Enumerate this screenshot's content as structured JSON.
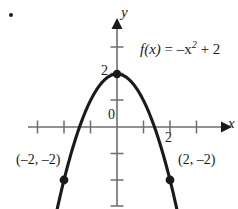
{
  "figure": {
    "bullet": "list-bullet",
    "background_color": "#ffffff",
    "ink_color": "#1a1a1a",
    "axis_color": "#6e6e6e"
  },
  "labels": {
    "y_axis": "y",
    "x_axis": "x",
    "origin": "0",
    "y_tick_2": "2",
    "x_tick_2": "2",
    "left_point": "(–2, –2)",
    "right_point": "(2, –2)",
    "function_prefix": "f",
    "function_arg": "(x)",
    "function_eq": " = –x",
    "function_exp": "2",
    "function_suffix": " + 2"
  },
  "chart_data": {
    "type": "line",
    "title": "",
    "subtitle": "",
    "xlabel": "x",
    "ylabel": "y",
    "equation": "f(x) = -x^2 + 2",
    "function_label_text": "f(x) = –x² + 2",
    "xlim": [
      -3.3,
      4.0
    ],
    "ylim": [
      -3.1,
      3.2
    ],
    "grid": false,
    "legend": null,
    "axes": {
      "x_axis_y_value": 0,
      "y_axis_x_value": 0,
      "x_arrow": "right",
      "y_arrow": "up",
      "x_ticks": [
        -3,
        -2,
        -1,
        1,
        2,
        3
      ],
      "y_ticks": [
        -3,
        -2,
        -1,
        1,
        2,
        3
      ],
      "x_tick_labels_shown": [
        {
          "value": 2,
          "text": "2"
        }
      ],
      "y_tick_labels_shown": [
        {
          "value": 2,
          "text": "2"
        }
      ],
      "origin_label": "0"
    },
    "series": [
      {
        "name": "f(x) = -x^2 + 2",
        "type": "parabola",
        "opens": "down",
        "vertex": [
          0,
          2
        ],
        "x": [
          -2.35,
          -2.0,
          -1.5,
          -1.0,
          -0.5,
          0,
          0.5,
          1.0,
          1.5,
          2.0,
          2.35
        ],
        "values": [
          -3.52,
          -2,
          0.25,
          1,
          1.75,
          2,
          1.75,
          1,
          0.25,
          -2,
          -3.52
        ]
      }
    ],
    "points": [
      {
        "label": "(–2, –2)",
        "x": -2,
        "y": -2,
        "marker": "filled-circle"
      },
      {
        "label": "(2, –2)",
        "x": 2,
        "y": -2,
        "marker": "filled-circle"
      },
      {
        "label": "",
        "x": 0,
        "y": 2,
        "marker": "filled-circle"
      }
    ],
    "annotations": [
      {
        "text": "f(x) = –x² + 2",
        "x": 1.0,
        "y": 2.9
      },
      {
        "text": "(–2, –2)",
        "x": -3.0,
        "y": -1.2
      },
      {
        "text": "(2, –2)",
        "x": 2.4,
        "y": -1.2
      }
    ],
    "arrows": [
      {
        "from": [
          -2.0,
          -2
        ],
        "to": [
          -2.45,
          -3.0
        ],
        "style": "curve-end-arrow"
      },
      {
        "from": [
          2.0,
          -2
        ],
        "to": [
          2.45,
          -3.0
        ],
        "style": "curve-end-arrow"
      }
    ]
  }
}
